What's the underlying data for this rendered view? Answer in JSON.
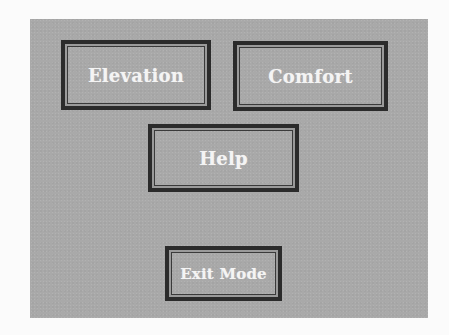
{
  "menu": {
    "buttons": [
      {
        "id": "elevation",
        "label": "Elevation"
      },
      {
        "id": "comfort",
        "label": "Comfort"
      },
      {
        "id": "help",
        "label": "Help"
      },
      {
        "id": "exit",
        "label": "Exit Mode"
      }
    ]
  },
  "colors": {
    "panel_background": "#a9a9a9",
    "button_border": "#2b2b2b",
    "button_text": "#f4f4f4"
  }
}
